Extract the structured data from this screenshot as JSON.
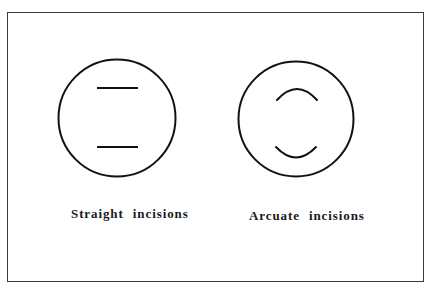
{
  "figure": {
    "border_color": "#3a3a3a",
    "stroke_color": "#111111",
    "panels": [
      {
        "id": "straight",
        "label": "Straight incisions",
        "circle": {
          "cx": 117,
          "cy": 118,
          "r": 58.5
        },
        "incisions": [
          {
            "type": "line",
            "x1": 97,
            "y1": 88,
            "x2": 138,
            "y2": 88
          },
          {
            "type": "line",
            "x1": 97,
            "y1": 147,
            "x2": 138,
            "y2": 147
          }
        ]
      },
      {
        "id": "arcuate",
        "label": "Arcuate incisions",
        "circle": {
          "cx": 296,
          "cy": 119,
          "r": 57.5
        },
        "incisions": [
          {
            "type": "arc",
            "d": "M 277 100 Q 297 78 317 100"
          },
          {
            "type": "arc",
            "d": "M 276 147 Q 296 168 316 147"
          }
        ]
      }
    ]
  }
}
